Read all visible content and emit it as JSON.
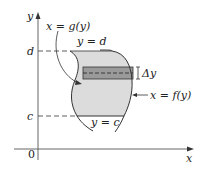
{
  "diagram": {
    "type": "region-between-curves-horizontal-strip",
    "axes": {
      "x_label": "x",
      "y_label": "y",
      "origin_label": "0"
    },
    "levels": {
      "top_label": "d",
      "bottom_label": "c"
    },
    "curves": {
      "left": "x = g(y)",
      "right": "x = f(y)",
      "top_line": "y = d",
      "bottom_line": "y = c"
    },
    "strip": {
      "height_label": "Δy"
    },
    "colors": {
      "region_fill": "#dcdcdc",
      "strip_fill": "#9a9a9a",
      "stroke": "#333333"
    }
  }
}
